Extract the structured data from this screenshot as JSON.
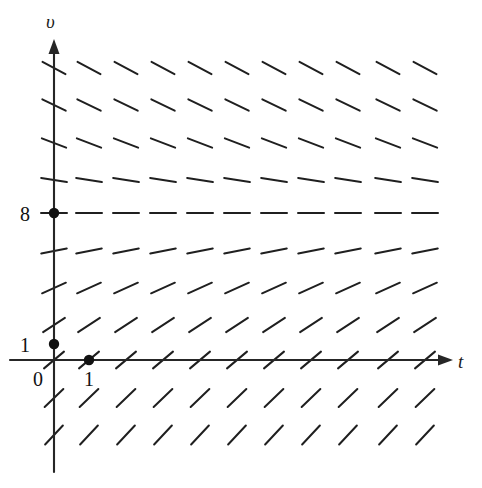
{
  "figure": {
    "kind": "slope-field",
    "title": "",
    "background": "#ffffff",
    "stroke_color": "#1f1f1f",
    "axis_color": "#262626"
  },
  "axes": {
    "x_axis": {
      "name": "t-axis",
      "label": "t",
      "arrow": true,
      "origin_px": [
        54,
        360
      ],
      "end_px": [
        452,
        360
      ]
    },
    "y_axis": {
      "name": "v-axis",
      "label": "υ",
      "arrow": true,
      "top_px": [
        54,
        40
      ],
      "bottom_px": [
        54,
        472
      ]
    },
    "origin_label": "0"
  },
  "tick_labels": [
    {
      "text": "8",
      "axis": "v",
      "value": 8,
      "px": [
        32,
        213
      ]
    },
    {
      "text": "1",
      "axis": "v",
      "value": 1,
      "px": [
        32,
        344
      ]
    },
    {
      "text": "1",
      "axis": "t",
      "value": 1,
      "px": [
        89,
        378
      ]
    },
    {
      "text": "0",
      "axis": "origin",
      "value": 0,
      "px": [
        38,
        378
      ]
    }
  ],
  "marked_points": [
    {
      "name": "point-v-8",
      "label": "8",
      "px": [
        54,
        213
      ]
    },
    {
      "name": "point-v-1",
      "label": "1",
      "px": [
        54,
        344
      ]
    },
    {
      "name": "point-t-1",
      "label": "1",
      "px": [
        89,
        360
      ]
    }
  ],
  "chart_data": {
    "type": "scatter",
    "subtype": "slope-field",
    "title": "",
    "xlabel": "t",
    "ylabel": "υ",
    "equilibrium_v": 8,
    "grid": {
      "t_px": [
        54,
        89,
        126,
        163,
        200,
        237,
        274,
        311,
        348,
        388,
        425
      ],
      "v_px": [
        68,
        105,
        143,
        180,
        213,
        251,
        288,
        325,
        360,
        398,
        435
      ],
      "t_values": [
        0,
        1,
        2,
        3,
        4,
        5,
        6,
        7,
        8,
        9,
        10
      ],
      "v_values": [
        12,
        11,
        10,
        9,
        8,
        7,
        6,
        5,
        4,
        3,
        2
      ],
      "segment_half_length": 13
    },
    "row_slopes_deg": [
      -28,
      -26,
      -21,
      -9,
      0,
      11,
      24,
      33,
      40,
      44,
      47
    ]
  }
}
